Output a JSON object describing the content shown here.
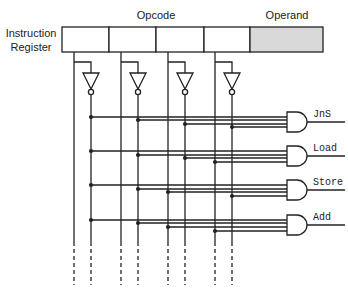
{
  "diagram": {
    "title_lines": [
      "Instruction",
      "Register"
    ],
    "opcode_label": "Opcode",
    "operand_label": "Operand",
    "colors": {
      "line": "#222222",
      "operand_fill": "#d9d9d9",
      "background": "#ffffff"
    },
    "register": {
      "x": 62,
      "y": 27,
      "height": 25,
      "opcode_bits": 4,
      "bit_dividers_x": [
        62,
        109,
        156,
        204,
        250
      ],
      "operand_end_x": 323
    },
    "bit_lines": [
      {
        "bit": 1,
        "true_x": 74,
        "inverted_x": 91
      },
      {
        "bit": 2,
        "true_x": 121,
        "inverted_x": 138
      },
      {
        "bit": 3,
        "true_x": 168,
        "inverted_x": 185
      },
      {
        "bit": 4,
        "true_x": 215,
        "inverted_x": 232
      }
    ],
    "decoder_rows": [
      {
        "name": "JnS",
        "opcode": "0000",
        "gate_y": 122,
        "wire_y": [
          117,
          120,
          124,
          127
        ]
      },
      {
        "name": "Load",
        "opcode": "0001",
        "gate_y": 156,
        "wire_y": [
          151,
          155,
          158,
          162
        ]
      },
      {
        "name": "Store",
        "opcode": "0010",
        "gate_y": 190,
        "wire_y": [
          185,
          189,
          192,
          196
        ]
      },
      {
        "name": "Add",
        "opcode": "0011",
        "gate_y": 225,
        "wire_y": [
          220,
          223,
          227,
          231
        ]
      }
    ],
    "gate_x": 287,
    "output_end_x": 345,
    "continuation": "dashed lines indicate more opcodes"
  }
}
